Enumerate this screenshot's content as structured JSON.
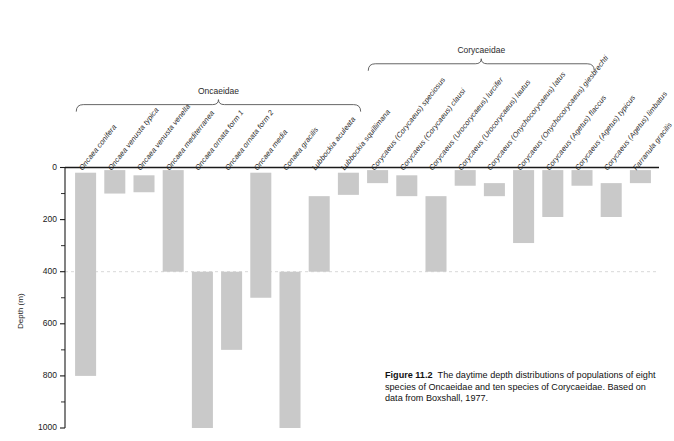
{
  "figure": {
    "number": "Figure 11.2",
    "caption_text": "The daytime depth distributions of populations of eight species of Oncaeidae and ten species of Corycaeidae. Based on data from Boxshall, 1977.",
    "groups": [
      {
        "name": "Oncaeidae",
        "first_index": 0,
        "last_index": 9
      },
      {
        "name": "Corycaeidae",
        "first_index": 10,
        "last_index": 17
      }
    ]
  },
  "axis": {
    "y_label": "Depth (m)",
    "y_ticks_major": [
      "0",
      "200",
      "400",
      "600",
      "800",
      "1000"
    ],
    "y_min": 0,
    "y_max": 1000,
    "minor_tick_step": 100,
    "reference_line_depth": 400
  },
  "colors": {
    "bar_fill": "#c9c9c9",
    "axis": "#1a1a1a",
    "bracket": "#555555",
    "reference_line": "#d8d8d8"
  },
  "chart_data": {
    "type": "bar",
    "title": "Figure 11.2",
    "xlabel": "",
    "ylabel": "Depth (m)",
    "ylim": [
      0,
      1000
    ],
    "y_inverted": true,
    "grid": false,
    "legend": "none",
    "value_unit": "m",
    "categories": [
      "Oncaea conifera",
      "Oncaea venusta typica",
      "Oncaea venusta venella",
      "Oncaea mediterranea",
      "Oncaea ornata form 1",
      "Oncaea ornata form 2",
      "Oncaea media",
      "Conaea gracilis",
      "Lubbockia aculeata",
      "Lubbockia squillimana",
      "Corycaeus (Corycaeus) speciosus",
      "Corycaeus (Corycaeus) clausi",
      "Corycaeus (Urocorycaeus) lurcifer",
      "Corycaeus (Urocorycaeus) lautus",
      "Corycaeus (Onychocorycaeus) latus",
      "Corycaeus (Onychocorycaeus) giesbrechti",
      "Corycaeus (Agetus) flaccus",
      "Corycaeus (Agetus) typicus",
      "Corycaeus (Agetus) limbatus",
      "Farranula gracilis"
    ],
    "ranges": [
      {
        "species": "Oncaea conifera",
        "top": 20,
        "bottom": 800
      },
      {
        "species": "Oncaea venusta typica",
        "top": 10,
        "bottom": 100
      },
      {
        "species": "Oncaea venusta venella",
        "top": 30,
        "bottom": 95
      },
      {
        "species": "Oncaea mediterranea",
        "top": 10,
        "bottom": 400
      },
      {
        "species": "Oncaea ornata form 1",
        "top": 400,
        "bottom": 1000
      },
      {
        "species": "Oncaea ornata form 2",
        "top": 400,
        "bottom": 700
      },
      {
        "species": "Oncaea media",
        "top": 20,
        "bottom": 500
      },
      {
        "species": "Conaea gracilis",
        "top": 400,
        "bottom": 1000
      },
      {
        "species": "Lubbockia aculeata",
        "top": 110,
        "bottom": 400
      },
      {
        "species": "Lubbockia squillimana",
        "top": 20,
        "bottom": 105
      },
      {
        "species": "Corycaeus (Corycaeus) speciosus",
        "top": 10,
        "bottom": 60
      },
      {
        "species": "Corycaeus (Corycaeus) clausi",
        "top": 30,
        "bottom": 110
      },
      {
        "species": "Corycaeus (Urocorycaeus) lurcifer",
        "top": 110,
        "bottom": 400
      },
      {
        "species": "Corycaeus (Urocorycaeus) lautus",
        "top": 10,
        "bottom": 70
      },
      {
        "species": "Corycaeus (Onychocorycaeus) latus",
        "top": 60,
        "bottom": 110
      },
      {
        "species": "Corycaeus (Onychocorycaeus) giesbrechti",
        "top": 10,
        "bottom": 290
      },
      {
        "species": "Corycaeus (Agetus) flaccus",
        "top": 10,
        "bottom": 190
      },
      {
        "species": "Corycaeus (Agetus) typicus",
        "top": 10,
        "bottom": 70
      },
      {
        "species": "Corycaeus (Agetus) limbatus",
        "top": 60,
        "bottom": 190
      },
      {
        "species": "Farranula gracilis",
        "top": 10,
        "bottom": 60
      }
    ]
  }
}
